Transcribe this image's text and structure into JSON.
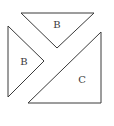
{
  "diagram": {
    "pieces": [
      {
        "id": "top",
        "label": "B"
      },
      {
        "id": "left",
        "label": "B"
      },
      {
        "id": "right",
        "label": "C"
      }
    ],
    "colors": {
      "stroke": "#3a3a3a",
      "fill": "#ffffff",
      "background": "#ffffff"
    }
  }
}
